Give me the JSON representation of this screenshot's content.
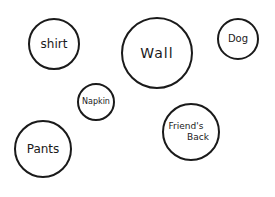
{
  "diagram": {
    "type": "hand-drawn circles",
    "stroke_color": "#1a1a1a",
    "background": "#ffffff",
    "bubbles": [
      {
        "id": "shirt",
        "label": "shirt",
        "cx": 54,
        "cy": 44,
        "r": 26,
        "font_size": 12
      },
      {
        "id": "wall",
        "label": "Wall",
        "cx": 157,
        "cy": 53,
        "r": 36,
        "font_size": 14
      },
      {
        "id": "dog",
        "label": "Dog",
        "cx": 238,
        "cy": 39,
        "r": 21,
        "font_size": 10
      },
      {
        "id": "napkin",
        "label": "Napkin",
        "cx": 96,
        "cy": 102,
        "r": 19,
        "font_size": 8
      },
      {
        "id": "pants",
        "label": "Pants",
        "cx": 43,
        "cy": 149,
        "r": 29,
        "font_size": 12
      },
      {
        "id": "friends-back",
        "label_line1": "Friend's",
        "label_line2": "Back",
        "cx": 191,
        "cy": 132,
        "r": 29,
        "font_size": 9
      }
    ]
  }
}
